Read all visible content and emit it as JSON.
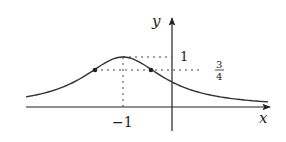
{
  "diagram": {
    "title": "",
    "function": "y = 1/(1+(x+1)^2)",
    "axes": {
      "x_label": "x",
      "y_label": "y",
      "x_tick_label": "−1",
      "y_tick_label_peak": "1",
      "y_tick_label_three_quarters_num": "3",
      "y_tick_label_three_quarters_den": "4"
    },
    "key_points": [
      {
        "name": "maximum",
        "x": -1,
        "y": 1
      },
      {
        "name": "inflection-left",
        "x": -1.577,
        "y": 0.75
      },
      {
        "name": "inflection-right",
        "x": -0.423,
        "y": 0.75
      }
    ],
    "colors": {
      "curve": "#333333",
      "axes": "#222222",
      "dotted": "#444444"
    }
  }
}
